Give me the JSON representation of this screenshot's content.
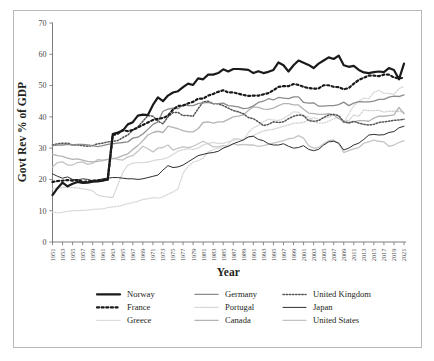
{
  "figure": {
    "frame_border_color": "#b9b9b9",
    "background": "#ffffff"
  },
  "axes": {
    "ylabel": "Govt Rev % of GDP",
    "xlabel": "Year",
    "yticks": [
      "0",
      "10",
      "20",
      "30",
      "40",
      "50",
      "60",
      "70"
    ],
    "xticks": [
      "1951",
      "1953",
      "1955",
      "1957",
      "1959",
      "1961",
      "1963",
      "1965",
      "1967",
      "1969",
      "1971",
      "1973",
      "1975",
      "1977",
      "1979",
      "1981",
      "1983",
      "1985",
      "1987",
      "1989",
      "1991",
      "1993",
      "1995",
      "1997",
      "1999",
      "2001",
      "2003",
      "2005",
      "2007",
      "2009",
      "2011",
      "2013",
      "2015",
      "2017",
      "2019",
      "2021"
    ]
  },
  "legend": {
    "entries": [
      {
        "label": "Norway",
        "color": "#1a1a1a",
        "width": 2.2,
        "dash": "none",
        "row": 0,
        "col": 0
      },
      {
        "label": "France",
        "color": "#1a1a1a",
        "width": 2.2,
        "dash": "dot",
        "row": 1,
        "col": 0
      },
      {
        "label": "Greece",
        "color": "#d6d6d6",
        "width": 1.3,
        "dash": "dot",
        "row": 2,
        "col": 0
      },
      {
        "label": "Germany",
        "color": "#8c8c8c",
        "width": 1.3,
        "dash": "none",
        "row": 0,
        "col": 1
      },
      {
        "label": "Portugal",
        "color": "#d2d2d2",
        "width": 1.3,
        "dash": "dot",
        "row": 1,
        "col": 1
      },
      {
        "label": "Canada",
        "color": "#b4b4b4",
        "width": 1.3,
        "dash": "none",
        "row": 2,
        "col": 1
      },
      {
        "label": "United Kingdom",
        "color": "#555555",
        "width": 1.5,
        "dash": "dot",
        "row": 0,
        "col": 2
      },
      {
        "label": "Japan",
        "color": "#2e2e2e",
        "width": 1.0,
        "dash": "none",
        "row": 1,
        "col": 2
      },
      {
        "label": "United States",
        "color": "#c4c4c4",
        "width": 1.3,
        "dash": "none",
        "row": 2,
        "col": 2
      }
    ]
  },
  "chart_data": {
    "type": "line",
    "title": "",
    "xlabel": "Year",
    "ylabel": "Govt Rev % of GDP",
    "xlim": [
      1951,
      2021
    ],
    "ylim": [
      0,
      70
    ],
    "grid": false,
    "legend_position": "bottom",
    "x": [
      1951,
      1952,
      1953,
      1954,
      1955,
      1956,
      1957,
      1958,
      1959,
      1960,
      1961,
      1962,
      1963,
      1964,
      1965,
      1966,
      1967,
      1968,
      1969,
      1970,
      1971,
      1972,
      1973,
      1974,
      1975,
      1976,
      1977,
      1978,
      1979,
      1980,
      1981,
      1982,
      1983,
      1984,
      1985,
      1986,
      1987,
      1988,
      1989,
      1990,
      1991,
      1992,
      1993,
      1994,
      1995,
      1996,
      1997,
      1998,
      1999,
      2000,
      2001,
      2002,
      2003,
      2004,
      2005,
      2006,
      2007,
      2008,
      2009,
      2010,
      2011,
      2012,
      2013,
      2014,
      2015,
      2016,
      2017,
      2018,
      2019,
      2020,
      2021
    ],
    "series": [
      {
        "name": "Norway",
        "color": "#1a1a1a",
        "values": [
          15.0,
          17.2,
          19.0,
          17.8,
          18.6,
          19.2,
          18.9,
          19.0,
          19.3,
          19.4,
          19.6,
          20.0,
          34.5,
          35.0,
          35.6,
          37.6,
          38.3,
          40.4,
          40.7,
          40.6,
          43.8,
          46.2,
          45.0,
          46.8,
          47.8,
          48.2,
          49.5,
          50.6,
          50.2,
          52.3,
          52.0,
          53.5,
          53.5,
          54.0,
          55.2,
          54.5,
          55.3,
          55.3,
          55.2,
          55.0,
          54.0,
          54.6,
          54.0,
          54.4,
          55.0,
          57.4,
          56.5,
          54.5,
          56.5,
          58.0,
          57.3,
          56.6,
          55.6,
          57.0,
          58.0,
          59.0,
          58.5,
          59.6,
          56.5,
          56.0,
          56.3,
          55.0,
          54.2,
          54.0,
          54.3,
          54.5,
          54.3,
          55.6,
          55.0,
          52.0,
          57.0
        ]
      },
      {
        "name": "France",
        "color": "#1a1a1a",
        "values": [
          19.2,
          19.5,
          19.6,
          19.8,
          19.6,
          19.8,
          19.2,
          19.3,
          19.6,
          19.7,
          19.8,
          19.9,
          34.2,
          34.6,
          35.8,
          35.4,
          35.8,
          36.6,
          37.4,
          38.2,
          39.0,
          39.4,
          39.6,
          40.4,
          42.3,
          43.5,
          43.6,
          44.3,
          44.8,
          45.8,
          45.8,
          46.8,
          47.3,
          48.0,
          48.5,
          47.8,
          47.8,
          47.4,
          47.0,
          46.7,
          46.8,
          46.8,
          47.2,
          47.6,
          48.5,
          49.6,
          49.8,
          49.8,
          50.5,
          50.2,
          49.6,
          49.2,
          49.0,
          49.1,
          50.1,
          50.1,
          49.6,
          49.5,
          48.8,
          49.2,
          50.6,
          51.8,
          52.5,
          53.2,
          53.2,
          53.0,
          53.5,
          53.5,
          52.6,
          52.3,
          52.5
        ]
      },
      {
        "name": "Greece",
        "color": "#d6d6d6",
        "values": [
          9.6,
          9.3,
          9.5,
          9.8,
          10.0,
          10.0,
          10.1,
          10.2,
          10.4,
          10.5,
          10.6,
          11.0,
          11.2,
          11.4,
          11.8,
          12.3,
          12.6,
          13.0,
          13.6,
          13.8,
          14.2,
          14.0,
          14.4,
          15.2,
          16.0,
          17.0,
          22.0,
          24.2,
          25.5,
          26.0,
          26.8,
          28.8,
          29.5,
          30.0,
          30.0,
          31.2,
          33.0,
          33.0,
          32.5,
          35.0,
          36.5,
          37.2,
          38.5,
          39.2,
          39.0,
          38.8,
          39.5,
          40.5,
          41.6,
          41.5,
          40.2,
          40.0,
          38.5,
          38.0,
          38.0,
          38.6,
          39.4,
          39.8,
          38.0,
          41.0,
          43.5,
          45.0,
          46.0,
          45.8,
          47.8,
          48.5,
          47.5,
          47.5,
          47.2,
          49.0,
          49.8
        ]
      },
      {
        "name": "Germany",
        "color": "#8c8c8c",
        "values": [
          30.8,
          31.0,
          31.0,
          31.2,
          31.0,
          31.2,
          31.2,
          31.0,
          30.8,
          30.5,
          30.8,
          31.2,
          31.4,
          31.6,
          31.8,
          32.0,
          33.2,
          33.5,
          34.5,
          36.0,
          37.6,
          38.4,
          41.8,
          42.5,
          42.8,
          42.6,
          43.8,
          43.6,
          43.6,
          44.2,
          44.5,
          44.6,
          44.3,
          44.2,
          44.4,
          43.6,
          43.4,
          43.2,
          42.6,
          42.8,
          43.5,
          44.6,
          45.0,
          45.8,
          45.4,
          46.2,
          46.0,
          45.8,
          46.4,
          46.4,
          44.6,
          44.4,
          44.5,
          43.4,
          43.4,
          43.6,
          43.6,
          43.9,
          44.7,
          43.6,
          44.4,
          44.9,
          44.8,
          44.8,
          45.0,
          45.6,
          45.6,
          46.3,
          46.6,
          46.5,
          47.0
        ]
      },
      {
        "name": "Portugal",
        "color": "#d2d2d2",
        "values": [
          17.0,
          17.2,
          17.4,
          17.5,
          17.4,
          17.3,
          17.0,
          16.8,
          16.3,
          15.0,
          14.6,
          14.4,
          14.2,
          18.2,
          22.2,
          24.6,
          25.2,
          25.4,
          25.4,
          25.5,
          26.0,
          26.3,
          26.5,
          27.0,
          28.0,
          29.0,
          29.5,
          29.8,
          29.6,
          30.0,
          31.0,
          31.5,
          31.8,
          31.5,
          31.5,
          32.0,
          32.5,
          32.8,
          32.8,
          33.5,
          34.0,
          34.8,
          35.5,
          35.8,
          36.0,
          36.5,
          37.0,
          37.4,
          38.0,
          38.0,
          38.2,
          39.0,
          39.8,
          39.2,
          39.6,
          40.0,
          40.6,
          40.2,
          38.8,
          38.8,
          40.6,
          40.2,
          42.2,
          42.0,
          42.0,
          42.1,
          41.5,
          41.8,
          41.8,
          41.8,
          41.4
        ]
      },
      {
        "name": "Canada",
        "color": "#b4b4b4",
        "values": [
          28.0,
          27.6,
          27.4,
          26.8,
          26.4,
          26.6,
          26.2,
          25.8,
          25.6,
          25.8,
          26.0,
          26.4,
          26.6,
          27.0,
          27.6,
          28.2,
          29.6,
          30.8,
          32.4,
          34.2,
          35.0,
          35.4,
          35.0,
          37.0,
          36.6,
          36.2,
          35.6,
          35.2,
          35.2,
          36.2,
          38.2,
          38.4,
          38.0,
          38.4,
          38.4,
          39.2,
          40.0,
          40.2,
          40.6,
          42.0,
          43.2,
          43.0,
          42.5,
          42.4,
          42.8,
          43.6,
          44.2,
          44.2,
          43.8,
          43.8,
          42.4,
          41.2,
          41.0,
          40.8,
          40.8,
          41.0,
          40.6,
          39.4,
          38.6,
          38.2,
          38.4,
          38.8,
          38.8,
          38.6,
          39.6,
          40.2,
          40.2,
          40.4,
          40.6,
          43.0,
          41.0
        ]
      },
      {
        "name": "United Kingdom",
        "color": "#555555",
        "values": [
          31.0,
          31.4,
          31.6,
          31.6,
          31.0,
          31.0,
          30.8,
          30.6,
          30.8,
          31.4,
          31.6,
          32.0,
          32.2,
          32.4,
          33.4,
          34.2,
          35.8,
          36.8,
          38.6,
          40.4,
          40.2,
          38.6,
          37.8,
          40.0,
          41.4,
          41.4,
          40.4,
          40.4,
          40.2,
          42.6,
          44.8,
          45.0,
          44.2,
          44.2,
          43.6,
          42.8,
          42.0,
          41.6,
          41.0,
          39.8,
          39.4,
          38.4,
          37.2,
          37.6,
          38.4,
          38.2,
          38.4,
          39.4,
          40.2,
          40.6,
          40.4,
          38.8,
          38.6,
          38.8,
          39.8,
          40.6,
          40.8,
          40.4,
          38.4,
          38.0,
          38.6,
          38.0,
          37.6,
          37.4,
          37.6,
          38.2,
          38.4,
          38.6,
          38.9,
          39.0,
          39.2
        ]
      },
      {
        "name": "Japan",
        "color": "#2e2e2e",
        "values": [
          21.8,
          21.0,
          20.4,
          20.8,
          20.0,
          19.8,
          20.2,
          20.0,
          19.6,
          19.8,
          20.2,
          20.4,
          20.6,
          20.6,
          20.4,
          20.2,
          20.2,
          20.0,
          20.2,
          20.6,
          21.0,
          21.4,
          23.0,
          24.4,
          23.8,
          24.0,
          24.6,
          25.6,
          26.6,
          27.6,
          28.0,
          28.4,
          28.6,
          29.0,
          30.0,
          30.6,
          31.4,
          32.0,
          32.6,
          33.6,
          33.8,
          32.8,
          32.4,
          31.4,
          31.0,
          31.0,
          31.4,
          30.6,
          30.0,
          30.2,
          30.8,
          29.6,
          29.2,
          29.6,
          31.0,
          32.0,
          32.2,
          31.6,
          29.4,
          30.0,
          31.0,
          31.6,
          32.8,
          34.2,
          34.4,
          34.2,
          34.3,
          35.0,
          35.3,
          36.5,
          37.0
        ]
      },
      {
        "name": "United States",
        "color": "#c4c4c4",
        "values": [
          24.0,
          25.4,
          25.6,
          24.6,
          24.6,
          25.4,
          25.6,
          24.8,
          25.2,
          26.4,
          26.2,
          26.4,
          26.8,
          26.4,
          26.2,
          27.2,
          27.6,
          29.0,
          30.6,
          29.8,
          28.8,
          30.0,
          30.2,
          31.0,
          29.4,
          30.0,
          30.4,
          30.2,
          30.6,
          31.4,
          32.2,
          31.4,
          30.4,
          30.4,
          30.8,
          30.6,
          31.4,
          31.0,
          31.2,
          31.0,
          31.0,
          30.6,
          30.8,
          31.2,
          31.6,
          32.0,
          32.4,
          33.0,
          33.2,
          34.0,
          33.2,
          30.8,
          30.0,
          30.2,
          31.4,
          32.4,
          32.6,
          31.4,
          28.6,
          29.2,
          29.8,
          30.2,
          31.6,
          32.0,
          32.6,
          32.2,
          32.0,
          30.6,
          31.0,
          31.8,
          32.4
        ]
      }
    ]
  }
}
